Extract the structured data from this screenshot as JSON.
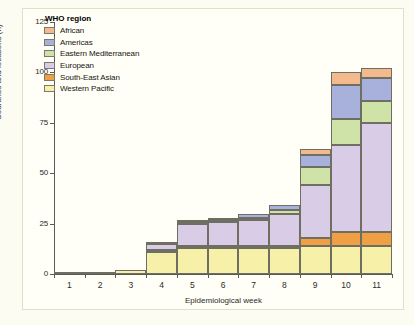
{
  "chart_data": {
    "type": "bar",
    "stacked": true,
    "title": "",
    "subtitle": "",
    "xlabel": "Epidemiological week",
    "ylabel": "Countries and locations (n)",
    "categories": [
      "1",
      "2",
      "3",
      "4",
      "5",
      "6",
      "7",
      "8",
      "9",
      "10",
      "11"
    ],
    "x": [
      1,
      2,
      3,
      4,
      5,
      6,
      7,
      8,
      9,
      10,
      11
    ],
    "ylim": [
      0,
      125
    ],
    "yticks": [
      0,
      25,
      50,
      75,
      100,
      125
    ],
    "ytick_labels": [
      "0",
      "25",
      "50",
      "75",
      "100",
      "125"
    ],
    "grid": false,
    "legend_position": "top-left",
    "legend_title": "WHO region",
    "series": [
      {
        "name": "Western Pacific",
        "color": "#f7f0a8",
        "values": [
          1,
          1,
          2,
          11,
          13,
          13,
          13,
          13,
          14,
          14,
          14
        ]
      },
      {
        "name": "South-East Asian",
        "color": "#f0a044",
        "values": [
          0,
          0,
          0,
          1,
          1,
          1,
          1,
          1,
          4,
          7,
          7
        ]
      },
      {
        "name": "European",
        "color": "#d9cce6",
        "values": [
          0,
          0,
          0,
          3,
          11,
          12,
          13,
          16,
          26,
          43,
          54
        ]
      },
      {
        "name": "Eastern Mediterranean",
        "color": "#cfe3a8",
        "values": [
          0,
          0,
          0,
          0,
          1,
          1,
          1,
          2,
          9,
          13,
          11
        ]
      },
      {
        "name": "Americas",
        "color": "#a8b0dc",
        "values": [
          0,
          0,
          0,
          1,
          1,
          1,
          2,
          2,
          6,
          17,
          11
        ]
      },
      {
        "name": "African",
        "color": "#f3bb8d",
        "values": [
          0,
          0,
          0,
          0,
          0,
          0,
          0,
          0,
          3,
          6,
          5
        ]
      }
    ],
    "totals": [
      1,
      1,
      2,
      16,
      27,
      28,
      30,
      34,
      62,
      100,
      102
    ]
  },
  "legend": {
    "title": "WHO region",
    "items": [
      {
        "label": "African",
        "color": "#f3bb8d"
      },
      {
        "label": "Americas",
        "color": "#a8b0dc"
      },
      {
        "label": "Eastern Mediterranean",
        "color": "#cfe3a8"
      },
      {
        "label": "European",
        "color": "#d9cce6"
      },
      {
        "label": "South-East Asian",
        "color": "#f0a044"
      },
      {
        "label": "Western Pacific",
        "color": "#f7f0a8"
      }
    ]
  },
  "axes": {
    "y_title": "Countries and locations (n)",
    "x_title": "Epidemiological week",
    "y_tick_labels": [
      "0",
      "25",
      "50",
      "75",
      "100",
      "125"
    ],
    "x_tick_labels": [
      "1",
      "2",
      "3",
      "4",
      "5",
      "6",
      "7",
      "8",
      "9",
      "10",
      "11"
    ]
  },
  "colors": {
    "axis": "#5b5b52",
    "bar_outline": "#6e6e62",
    "background": "#fffef7",
    "page_background": "#fdfcf3"
  }
}
